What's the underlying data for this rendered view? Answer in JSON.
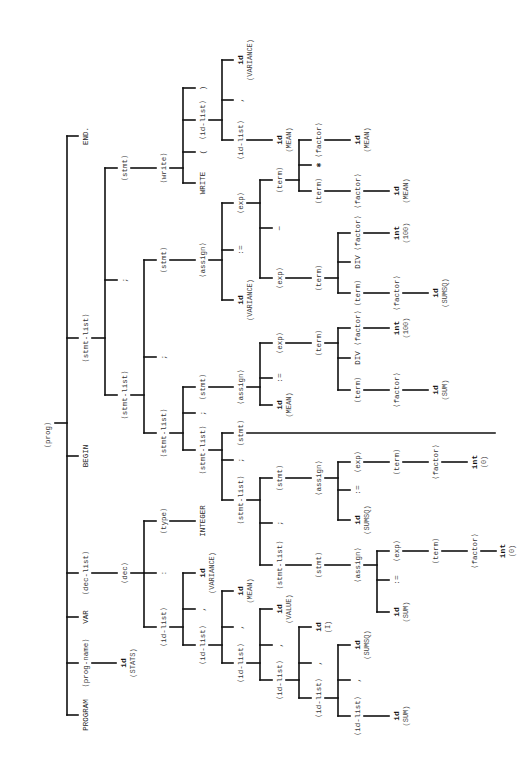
{
  "diagram": {
    "orientation": "root-left, rotated text",
    "line_color": "#111111",
    "text_color": "#333333",
    "nodes": [
      {
        "id": "prog",
        "label": "⟨prog⟩",
        "x": 48,
        "y": 435,
        "cls": ""
      },
      {
        "id": "end",
        "label": "END.",
        "x": 86,
        "y": 136,
        "cls": "kw"
      },
      {
        "id": "stmtlist1",
        "label": "⟨stmt-list⟩",
        "x": 86,
        "y": 338,
        "cls": ""
      },
      {
        "id": "begin",
        "label": "BEGIN",
        "x": 86,
        "y": 456,
        "cls": "kw"
      },
      {
        "id": "declist",
        "label": "⟨dec-list⟩",
        "x": 86,
        "y": 573,
        "cls": ""
      },
      {
        "id": "var",
        "label": "VAR",
        "x": 86,
        "y": 617,
        "cls": "kw"
      },
      {
        "id": "progname",
        "label": "⟨prog-name⟩",
        "x": 86,
        "y": 663,
        "cls": ""
      },
      {
        "id": "program",
        "label": "PROGRAM",
        "x": 86,
        "y": 715,
        "cls": "kw"
      },
      {
        "id": "progname_id",
        "label": "id",
        "x": 124,
        "y": 663,
        "cls": "tok"
      },
      {
        "id": "progname_val",
        "label": "(STATS)",
        "x": 133,
        "y": 663,
        "cls": "val"
      },
      {
        "id": "stmt_write",
        "label": "⟨stmt⟩",
        "x": 125,
        "y": 168,
        "cls": ""
      },
      {
        "id": "semi1",
        "label": ";",
        "x": 125,
        "y": 280,
        "cls": "punct"
      },
      {
        "id": "stmtlist2",
        "label": "⟨stmt-list⟩",
        "x": 125,
        "y": 395,
        "cls": ""
      },
      {
        "id": "write",
        "label": "⟨write⟩",
        "x": 164,
        "y": 168,
        "cls": ""
      },
      {
        "id": "write_kw",
        "label": "WRITE",
        "x": 203,
        "y": 183,
        "cls": "kw"
      },
      {
        "id": "lparen",
        "label": "(",
        "x": 203,
        "y": 152,
        "cls": "punct"
      },
      {
        "id": "idlist_w",
        "label": "⟨id-list⟩",
        "x": 203,
        "y": 120,
        "cls": ""
      },
      {
        "id": "rparen",
        "label": ")",
        "x": 203,
        "y": 88,
        "cls": "punct"
      },
      {
        "id": "idlist_w2",
        "label": "⟨id-list⟩",
        "x": 241,
        "y": 140,
        "cls": ""
      },
      {
        "id": "comma_w",
        "label": ",",
        "x": 241,
        "y": 100,
        "cls": "punct"
      },
      {
        "id": "w_var_id",
        "label": "id",
        "x": 241,
        "y": 60,
        "cls": "tok"
      },
      {
        "id": "w_var_val",
        "label": "(VARIANCE)",
        "x": 250,
        "y": 60,
        "cls": "val"
      },
      {
        "id": "w_mean_id",
        "label": "id",
        "x": 280,
        "y": 140,
        "cls": "tok"
      },
      {
        "id": "w_mean_val",
        "label": "(MEAN)",
        "x": 289,
        "y": 140,
        "cls": "val"
      },
      {
        "id": "stmt_assign3",
        "label": "⟨stmt⟩",
        "x": 164,
        "y": 260,
        "cls": ""
      },
      {
        "id": "semi2",
        "label": ";",
        "x": 164,
        "y": 357,
        "cls": "punct"
      },
      {
        "id": "stmtlist3",
        "label": "⟨stmt-list⟩",
        "x": 164,
        "y": 433,
        "cls": ""
      },
      {
        "id": "assign3",
        "label": "⟨assign⟩",
        "x": 203,
        "y": 260,
        "cls": ""
      },
      {
        "id": "a3_id",
        "label": "id",
        "x": 241,
        "y": 300,
        "cls": "tok"
      },
      {
        "id": "a3_val",
        "label": "(VARIANCE)",
        "x": 250,
        "y": 300,
        "cls": "val"
      },
      {
        "id": "a3_asg",
        "label": ":=",
        "x": 241,
        "y": 250,
        "cls": "punct"
      },
      {
        "id": "a3_exp",
        "label": "⟨exp⟩",
        "x": 241,
        "y": 203,
        "cls": ""
      },
      {
        "id": "a3_exp_r",
        "label": "⟨exp⟩",
        "x": 280,
        "y": 278,
        "cls": ""
      },
      {
        "id": "a3_minus",
        "label": "−",
        "x": 280,
        "y": 228,
        "cls": "punct"
      },
      {
        "id": "a3_term_l",
        "label": "⟨term⟩",
        "x": 280,
        "y": 180,
        "cls": ""
      },
      {
        "id": "a3_term_mul_t",
        "label": "⟨term⟩",
        "x": 319,
        "y": 191,
        "cls": ""
      },
      {
        "id": "a3_mul",
        "label": "✱",
        "x": 319,
        "y": 165,
        "cls": "punct"
      },
      {
        "id": "a3_mul_factor",
        "label": "⟨factor⟩",
        "x": 319,
        "y": 140,
        "cls": ""
      },
      {
        "id": "a3_mul_f_id",
        "label": "id",
        "x": 358,
        "y": 140,
        "cls": "tok"
      },
      {
        "id": "a3_mul_f_val",
        "label": "(MEAN)",
        "x": 367,
        "y": 140,
        "cls": "val"
      },
      {
        "id": "a3_term_factor",
        "label": "⟨factor⟩",
        "x": 358,
        "y": 191,
        "cls": ""
      },
      {
        "id": "a3_tf_id",
        "label": "id",
        "x": 397,
        "y": 191,
        "cls": "tok"
      },
      {
        "id": "a3_tf_val",
        "label": "(MEAN)",
        "x": 406,
        "y": 191,
        "cls": "val"
      },
      {
        "id": "a3_term_r",
        "label": "⟨term⟩",
        "x": 319,
        "y": 278,
        "cls": ""
      },
      {
        "id": "a3_div_term",
        "label": "⟨term⟩",
        "x": 358,
        "y": 293,
        "cls": ""
      },
      {
        "id": "a3_div",
        "label": "DIV",
        "x": 358,
        "y": 262,
        "cls": "kw"
      },
      {
        "id": "a3_div_factor",
        "label": "⟨factor⟩",
        "x": 358,
        "y": 233,
        "cls": ""
      },
      {
        "id": "a3_df_int",
        "label": "int",
        "x": 397,
        "y": 233,
        "cls": "tok"
      },
      {
        "id": "a3_df_val",
        "label": "(100)",
        "x": 406,
        "y": 233,
        "cls": "val"
      },
      {
        "id": "a3_dt_factor",
        "label": "⟨factor⟩",
        "x": 397,
        "y": 293,
        "cls": ""
      },
      {
        "id": "a3_dt_id",
        "label": "id",
        "x": 436,
        "y": 293,
        "cls": "tok"
      },
      {
        "id": "a3_dt_val",
        "label": "(SUMSQ)",
        "x": 445,
        "y": 293,
        "cls": "val"
      },
      {
        "id": "stmt_assign2",
        "label": "⟨stmt⟩",
        "x": 203,
        "y": 387,
        "cls": ""
      },
      {
        "id": "semi3",
        "label": ";",
        "x": 203,
        "y": 413,
        "cls": "punct"
      },
      {
        "id": "stmtlist4",
        "label": "⟨stmt-list⟩",
        "x": 203,
        "y": 450,
        "cls": ""
      },
      {
        "id": "assign2",
        "label": "⟨assign⟩",
        "x": 241,
        "y": 387,
        "cls": ""
      },
      {
        "id": "a2_id",
        "label": "id",
        "x": 280,
        "y": 405,
        "cls": "tok"
      },
      {
        "id": "a2_val",
        "label": "(MEAN)",
        "x": 289,
        "y": 405,
        "cls": "val"
      },
      {
        "id": "a2_asg",
        "label": ":=",
        "x": 280,
        "y": 378,
        "cls": "punct"
      },
      {
        "id": "a2_exp",
        "label": "⟨exp⟩",
        "x": 280,
        "y": 343,
        "cls": ""
      },
      {
        "id": "a2_term",
        "label": "⟨term⟩",
        "x": 319,
        "y": 343,
        "cls": ""
      },
      {
        "id": "a2_term2",
        "label": "⟨term⟩",
        "x": 358,
        "y": 390,
        "cls": ""
      },
      {
        "id": "a2_div",
        "label": "DIV",
        "x": 358,
        "y": 358,
        "cls": "kw"
      },
      {
        "id": "a2_factor_int",
        "label": "⟨factor⟩",
        "x": 358,
        "y": 328,
        "cls": ""
      },
      {
        "id": "a2_int",
        "label": "int",
        "x": 397,
        "y": 328,
        "cls": "tok"
      },
      {
        "id": "a2_int_val",
        "label": "(100)",
        "x": 406,
        "y": 328,
        "cls": "val"
      },
      {
        "id": "a2_factor_id",
        "label": "⟨factor⟩",
        "x": 397,
        "y": 390,
        "cls": ""
      },
      {
        "id": "a2_fid",
        "label": "id",
        "x": 436,
        "y": 390,
        "cls": "tok"
      },
      {
        "id": "a2_fid_val",
        "label": "(SUM)",
        "x": 445,
        "y": 390,
        "cls": "val"
      },
      {
        "id": "stmt_long",
        "label": "⟨stmt⟩",
        "x": 241,
        "y": 433,
        "cls": ""
      },
      {
        "id": "semi4",
        "label": ";",
        "x": 241,
        "y": 460,
        "cls": "punct"
      },
      {
        "id": "stmtlist5",
        "label": "⟨stmt-list⟩",
        "x": 241,
        "y": 500,
        "cls": ""
      },
      {
        "id": "stmt_sumsq",
        "label": "⟨stmt⟩",
        "x": 280,
        "y": 478,
        "cls": ""
      },
      {
        "id": "semi5",
        "label": ";",
        "x": 280,
        "y": 523,
        "cls": "punct"
      },
      {
        "id": "stmtlist6",
        "label": "⟨stmt-list⟩",
        "x": 280,
        "y": 565,
        "cls": ""
      },
      {
        "id": "assign_sumsq",
        "label": "⟨assign⟩",
        "x": 319,
        "y": 478,
        "cls": ""
      },
      {
        "id": "as_id",
        "label": "id",
        "x": 358,
        "y": 520,
        "cls": "tok"
      },
      {
        "id": "as_val",
        "label": "(SUMSQ)",
        "x": 367,
        "y": 520,
        "cls": "val"
      },
      {
        "id": "as_asg",
        "label": ":=",
        "x": 358,
        "y": 490,
        "cls": "punct"
      },
      {
        "id": "as_exp",
        "label": "⟨exp⟩",
        "x": 358,
        "y": 462,
        "cls": ""
      },
      {
        "id": "as_term",
        "label": "⟨term⟩",
        "x": 397,
        "y": 462,
        "cls": ""
      },
      {
        "id": "as_factor",
        "label": "⟨factor⟩",
        "x": 436,
        "y": 462,
        "cls": ""
      },
      {
        "id": "as_int",
        "label": "int",
        "x": 475,
        "y": 462,
        "cls": "tok"
      },
      {
        "id": "as_int_val",
        "label": "(0)",
        "x": 484,
        "y": 462,
        "cls": "val"
      },
      {
        "id": "stmt_sum",
        "label": "⟨stmt⟩",
        "x": 319,
        "y": 565,
        "cls": ""
      },
      {
        "id": "assign_sum",
        "label": "⟨assign⟩",
        "x": 358,
        "y": 565,
        "cls": ""
      },
      {
        "id": "su_id",
        "label": "id",
        "x": 397,
        "y": 612,
        "cls": "tok"
      },
      {
        "id": "su_val",
        "label": "(SUM)",
        "x": 406,
        "y": 612,
        "cls": "val"
      },
      {
        "id": "su_asg",
        "label": ":=",
        "x": 397,
        "y": 580,
        "cls": "punct"
      },
      {
        "id": "su_exp",
        "label": "⟨exp⟩",
        "x": 397,
        "y": 551,
        "cls": ""
      },
      {
        "id": "su_term",
        "label": "⟨term⟩",
        "x": 436,
        "y": 551,
        "cls": ""
      },
      {
        "id": "su_factor",
        "label": "⟨factor⟩",
        "x": 475,
        "y": 551,
        "cls": ""
      },
      {
        "id": "su_int",
        "label": "int",
        "x": 503,
        "y": 551,
        "cls": "tok"
      },
      {
        "id": "su_int_val",
        "label": "(0)",
        "x": 512,
        "y": 551,
        "cls": "val"
      },
      {
        "id": "dec",
        "label": "⟨dec⟩",
        "x": 125,
        "y": 573,
        "cls": ""
      },
      {
        "id": "type",
        "label": "⟨type⟩",
        "x": 164,
        "y": 521,
        "cls": ""
      },
      {
        "id": "integer",
        "label": "INTEGER",
        "x": 203,
        "y": 521,
        "cls": "kw"
      },
      {
        "id": "colon",
        "label": ":",
        "x": 164,
        "y": 573,
        "cls": "punct"
      },
      {
        "id": "idlist1",
        "label": "⟨id-list⟩",
        "x": 164,
        "y": 627,
        "cls": ""
      },
      {
        "id": "d_var_id",
        "label": "id",
        "x": 203,
        "y": 573,
        "cls": "tok"
      },
      {
        "id": "d_var_val",
        "label": "(VARIANCE)",
        "x": 212,
        "y": 573,
        "cls": "val"
      },
      {
        "id": "d_comma1",
        "label": ",",
        "x": 203,
        "y": 609,
        "cls": "punct"
      },
      {
        "id": "idlist2",
        "label": "⟨id-list⟩",
        "x": 203,
        "y": 645,
        "cls": ""
      },
      {
        "id": "d_mean_id",
        "label": "id",
        "x": 241,
        "y": 591,
        "cls": "tok"
      },
      {
        "id": "d_mean_val",
        "label": "(MEAN)",
        "x": 250,
        "y": 591,
        "cls": "val"
      },
      {
        "id": "d_comma2",
        "label": ",",
        "x": 241,
        "y": 627,
        "cls": "punct"
      },
      {
        "id": "idlist3",
        "label": "⟨id-list⟩",
        "x": 241,
        "y": 663,
        "cls": ""
      },
      {
        "id": "d_value_id",
        "label": "id",
        "x": 280,
        "y": 609,
        "cls": "tok"
      },
      {
        "id": "d_value_val",
        "label": "(VALUE)",
        "x": 289,
        "y": 609,
        "cls": "val"
      },
      {
        "id": "d_comma3",
        "label": ",",
        "x": 280,
        "y": 645,
        "cls": "punct"
      },
      {
        "id": "idlist4",
        "label": "⟨id-list⟩",
        "x": 280,
        "y": 680,
        "cls": ""
      },
      {
        "id": "d_i_id",
        "label": "id",
        "x": 319,
        "y": 627,
        "cls": "tok"
      },
      {
        "id": "d_i_val",
        "label": "(I)",
        "x": 328,
        "y": 627,
        "cls": "val"
      },
      {
        "id": "d_comma4",
        "label": ",",
        "x": 319,
        "y": 663,
        "cls": "punct"
      },
      {
        "id": "idlist5",
        "label": "⟨id-list⟩",
        "x": 319,
        "y": 698,
        "cls": ""
      },
      {
        "id": "d_sumsq_id",
        "label": "id",
        "x": 358,
        "y": 645,
        "cls": "tok"
      },
      {
        "id": "d_sumsq_val",
        "label": "(SUMSQ)",
        "x": 367,
        "y": 645,
        "cls": "val"
      },
      {
        "id": "d_comma5",
        "label": ",",
        "x": 358,
        "y": 680,
        "cls": "punct"
      },
      {
        "id": "idlist6",
        "label": "⟨id-list⟩",
        "x": 358,
        "y": 716,
        "cls": ""
      },
      {
        "id": "d_sum_id",
        "label": "id",
        "x": 397,
        "y": 716,
        "cls": "tok"
      },
      {
        "id": "d_sum_val",
        "label": "(SUM)",
        "x": 406,
        "y": 716,
        "cls": "val"
      }
    ]
  }
}
